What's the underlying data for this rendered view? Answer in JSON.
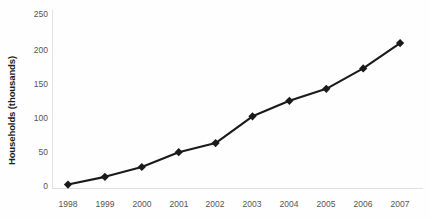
{
  "chart_data": {
    "type": "line",
    "title": "",
    "subtitle": "",
    "xlabel": "",
    "ylabel": "Households (thousands)",
    "categories": [
      "1998",
      "1999",
      "2000",
      "2001",
      "2002",
      "2003",
      "2004",
      "2005",
      "2006",
      "2007"
    ],
    "x": [
      1998,
      1999,
      2000,
      2001,
      2002,
      2003,
      2004,
      2005,
      2006,
      2007
    ],
    "values": [
      2,
      13,
      27,
      48,
      61,
      99,
      121,
      138,
      167,
      203
    ],
    "series": [
      {
        "name": "Households",
        "values": [
          2,
          13,
          27,
          48,
          61,
          99,
          121,
          138,
          167,
          203
        ]
      }
    ],
    "ylim": [
      0,
      250
    ],
    "yticks": [
      0,
      50,
      100,
      150,
      200,
      250
    ],
    "ytick_labels": [
      "0",
      "50",
      "100",
      "150",
      "200",
      "250"
    ],
    "grid": false,
    "legend": "none",
    "marker": "diamond",
    "line_color": "#1a1a1a",
    "marker_color": "#1a1a1a",
    "background_color": "#fefefe",
    "axis_color": "#e0e0e0",
    "tick_label_color": "#555555",
    "axis_title_color": "#1d1d1d"
  }
}
